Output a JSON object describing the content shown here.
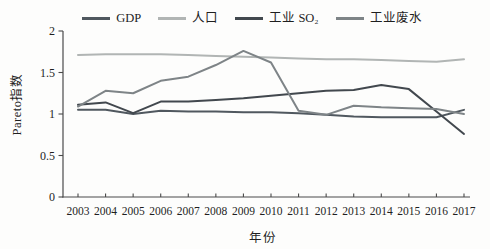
{
  "figure": {
    "y_axis_label": "Pareto指数",
    "x_axis_label": "年份"
  },
  "chart_data": {
    "type": "line",
    "x": [
      2003,
      2004,
      2005,
      2006,
      2007,
      2008,
      2009,
      2010,
      2011,
      2012,
      2013,
      2014,
      2015,
      2016,
      2017
    ],
    "x_tick_labels": [
      "2003",
      "2004",
      "2005",
      "2006",
      "2007",
      "2008",
      "2009",
      "2010",
      "2011",
      "2012",
      "2013",
      "2014",
      "2015",
      "2016",
      "2017"
    ],
    "y_ticks": [
      0,
      0.5,
      1,
      1.5,
      2
    ],
    "y_tick_labels": [
      "0",
      "0.5",
      "1",
      "1.5",
      "2"
    ],
    "ylim": [
      0,
      2
    ],
    "grid": false,
    "legend_position": "top",
    "axis_color": "#4a4a4a",
    "tick_label_color": "#1f1f1f",
    "series": [
      {
        "name": "GDP",
        "color": "#50585f",
        "values": [
          1.05,
          1.05,
          1.0,
          1.04,
          1.03,
          1.03,
          1.02,
          1.02,
          1.01,
          0.99,
          0.97,
          0.96,
          0.96,
          0.96,
          1.05
        ]
      },
      {
        "name": "人口",
        "color": "#b1b5b4",
        "values": [
          1.71,
          1.72,
          1.72,
          1.72,
          1.71,
          1.7,
          1.69,
          1.68,
          1.67,
          1.66,
          1.66,
          1.65,
          1.64,
          1.63,
          1.66
        ]
      },
      {
        "name": "工业 SO₂",
        "color": "#42484e",
        "values": [
          1.11,
          1.14,
          1.01,
          1.15,
          1.15,
          1.17,
          1.19,
          1.22,
          1.25,
          1.28,
          1.29,
          1.35,
          1.3,
          1.03,
          0.76
        ]
      },
      {
        "name": "工业废水",
        "color": "#7e8487",
        "values": [
          1.09,
          1.28,
          1.25,
          1.4,
          1.45,
          1.59,
          1.76,
          1.62,
          1.04,
          0.99,
          1.1,
          1.08,
          1.07,
          1.06,
          1.0
        ]
      }
    ]
  }
}
